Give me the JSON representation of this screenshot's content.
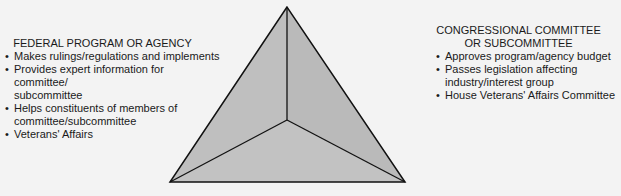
{
  "diagram": {
    "type": "iron-triangle",
    "left_block": {
      "title": "FEDERAL PROGRAM OR AGENCY",
      "items": [
        {
          "line1": "Makes rulings/regulations and implements",
          "line2": ""
        },
        {
          "line1": "Provides expert information for committee/",
          "line2": "subcommittee"
        },
        {
          "line1": "Helps constituents of members of",
          "line2": "committee/subcommittee"
        },
        {
          "line1": "Veterans' Affairs",
          "line2": ""
        }
      ]
    },
    "right_block": {
      "title_line1": "CONGRESSIONAL COMMITTEE",
      "title_line2": "OR SUBCOMMITTEE",
      "items": [
        "Approves program/agency budget",
        "Passes legislation affecting industry/interest group",
        "House Veterans' Affairs Committee"
      ]
    },
    "colors": {
      "triangle_fill": "#bdbdbd",
      "stroke": "#111111",
      "background": "#f3f3f3"
    }
  }
}
